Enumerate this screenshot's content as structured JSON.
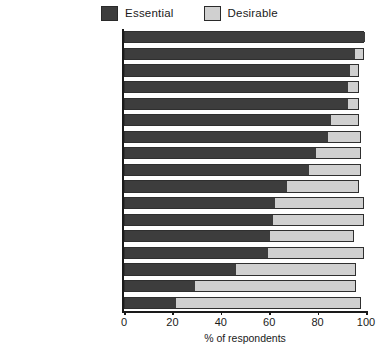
{
  "chart_data": {
    "type": "bar",
    "orientation": "horizontal",
    "stacked": true,
    "title": "",
    "xlabel": "% of respondents",
    "ylabel": "",
    "xlim": [
      0,
      100
    ],
    "xticks": [
      0,
      20,
      40,
      60,
      80,
      100
    ],
    "grid": false,
    "legend_position": "top-center",
    "categories": [
      "Doctor",
      "Hospital",
      "Chemist",
      "Post office",
      "Dentist",
      "Optician",
      "Public transport (children)",
      "Petrol station",
      "Bank/building society",
      "Train/tube service",
      "Corner shop",
      "Supermarket",
      "Youth clubs",
      "Public community village",
      "Place of worship",
      "Pub",
      "Cinema/theatre"
    ],
    "series": [
      {
        "name": "Essential",
        "color": "#3d3d3d",
        "values": [
          99,
          95,
          93,
          92,
          92,
          85,
          84,
          79,
          76,
          67,
          62,
          61,
          60,
          59,
          46,
          29,
          21
        ]
      },
      {
        "name": "Desirable",
        "color": "#d0d0d0",
        "values": [
          0,
          4,
          4,
          5,
          5,
          12,
          14,
          19,
          22,
          30,
          37,
          38,
          35,
          40,
          50,
          67,
          77
        ]
      }
    ],
    "totals": [
      99,
      99,
      97,
      97,
      97,
      97,
      98,
      98,
      98,
      97,
      99,
      99,
      95,
      99,
      96,
      96,
      98
    ]
  },
  "legend": {
    "items": [
      {
        "label": "Essential",
        "color": "#3d3d3d",
        "swatch": "legend-swatch-essential"
      },
      {
        "label": "Desirable",
        "color": "#d0d0d0",
        "swatch": "legend-swatch-desirable"
      }
    ]
  },
  "footer": {
    "source_note": ""
  }
}
